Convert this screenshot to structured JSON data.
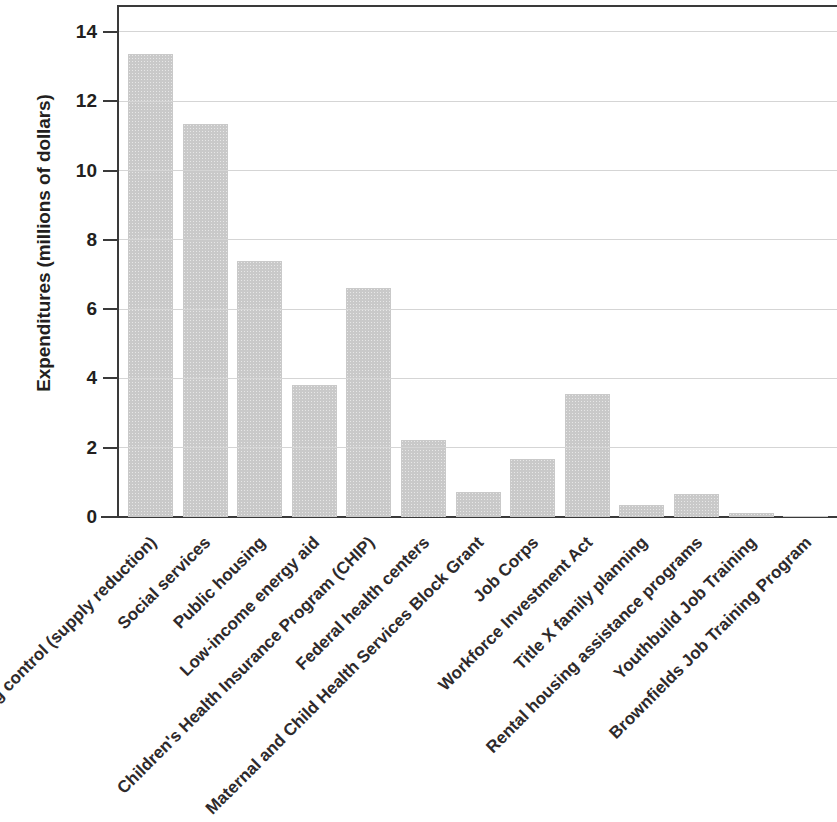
{
  "chart_data": {
    "type": "bar",
    "title": "",
    "subtitle": "",
    "xlabel": "",
    "ylabel": "Expenditures (millions of dollars)",
    "ylim": [
      0,
      14.8
    ],
    "yticks": [
      0,
      2,
      4,
      6,
      8,
      10,
      12,
      14
    ],
    "ytick_labels": [
      "0",
      "2",
      "4",
      "6",
      "8",
      "10",
      "12",
      "14"
    ],
    "grid": "horizontal",
    "legend": "none",
    "bar_color": "#c9c9c9",
    "axis_color": "#3a3a3a",
    "gridline_color": "#d5d5d5",
    "categories": [
      "Drug control (supply reduction)",
      "Social services",
      "Public housing",
      "Low-income energy aid",
      "Children's Health Insurance Program (CHIP)",
      "Federal health centers",
      "Maternal and Child Health Services Block Grant",
      "Job Corps",
      "Workforce Investment Act",
      "Title X family planning",
      "Rental housing assistance programs",
      "Youthbuild Job Training",
      "Brownfields Job Training Program"
    ],
    "values": [
      13.35,
      11.33,
      7.4,
      3.82,
      6.62,
      2.22,
      0.72,
      1.67,
      3.55,
      0.36,
      0.65,
      0.12,
      0.02
    ]
  }
}
